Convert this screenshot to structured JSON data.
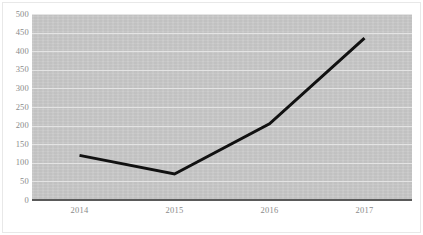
{
  "chart_data": {
    "type": "line",
    "title": "",
    "subtitle": "",
    "xlabel": "",
    "ylabel": "",
    "categories": [
      "2014",
      "2015",
      "2016",
      "2017"
    ],
    "x": [
      2014,
      2015,
      2016,
      2017
    ],
    "series": [
      {
        "name": "",
        "values": [
          120,
          70,
          205,
          435
        ]
      }
    ],
    "values": [
      120,
      70,
      205,
      435
    ],
    "ylim": [
      0,
      500
    ],
    "yticks": [
      0,
      50,
      100,
      150,
      200,
      250,
      300,
      350,
      400,
      450,
      500
    ],
    "ytick_labels": [
      "0",
      "50",
      "100",
      "150",
      "200",
      "250",
      "300",
      "350",
      "400",
      "450",
      "500"
    ],
    "xtick_labels": [
      "2014",
      "2015",
      "2016",
      "2017"
    ],
    "grid": true,
    "grid_axis": "y",
    "legend": false,
    "legend_position": "none",
    "annotations": [],
    "colors": {
      "line": "#111111",
      "plot_background": "#c9c9c9",
      "gridline": "#e4e4e4",
      "axis_line": "#5a5a5a",
      "tick_label": "#8a8a8a",
      "figure_background": "#ffffff"
    }
  }
}
